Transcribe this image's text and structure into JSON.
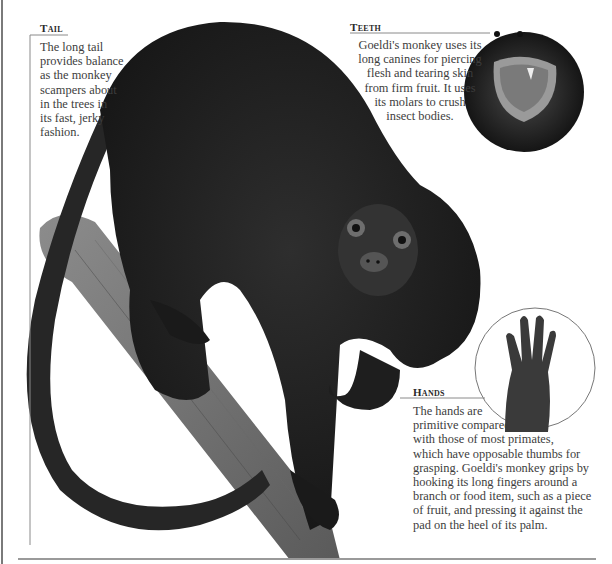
{
  "page": {
    "background": "#ffffff",
    "text_color": "#3d3d3d"
  },
  "callouts": {
    "tail": {
      "heading": "Tail",
      "lines": [
        "The long tail",
        "provides balance",
        "as the monkey",
        "scampers about",
        "in the trees in",
        "its fast, jerky",
        "fashion."
      ]
    },
    "teeth": {
      "heading": "Teeth",
      "lines": [
        "Goeldi's monkey uses its",
        "long canines for piercing",
        "flesh and tearing skin",
        "from firm fruit. It uses",
        "its molars to crush",
        "insect bodies."
      ]
    },
    "hands": {
      "heading": "Hands",
      "lines": [
        "The hands are",
        "primitive compared",
        "with those of most primates,",
        "which have opposable thumbs for",
        "grasping. Goeldi's monkey grips by",
        "hooking its long fingers around a",
        "branch or food item, such as a piece",
        "of fruit, and pressing it against the",
        "pad on the heel of its palm."
      ]
    }
  },
  "images": {
    "main": "goeldis-monkey-on-branch",
    "inset_teeth": "open-mouth-closeup",
    "inset_hands": "hand-palm-closeup"
  }
}
